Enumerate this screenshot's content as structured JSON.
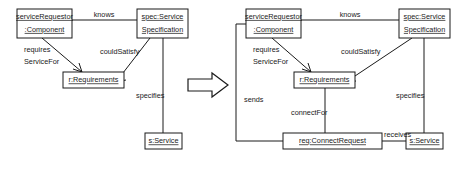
{
  "figure": {
    "type": "uml-object-diagram-pair",
    "background": "#ffffff",
    "stroke_color": "#1a1a1a",
    "transform_icon": "block-arrow-right-icon"
  },
  "left_diagram": {
    "name": "before-transformation",
    "nodes": {
      "service_requestor": {
        "line1": "serviceRequestor",
        "line2": ":Component"
      },
      "spec": {
        "line1": "spec:Service",
        "line2": "Specification"
      },
      "requirements": {
        "line1": "r:Requirements"
      },
      "service": {
        "line1": "s:Service"
      }
    },
    "edges": {
      "knows": "knows",
      "requires_line1": "requires",
      "requires_line2": "ServiceFor",
      "could_satisfy": "couldSatisfy",
      "specifies": "specifies"
    }
  },
  "right_diagram": {
    "name": "after-transformation",
    "nodes": {
      "service_requestor": {
        "line1": "serviceRequestor",
        "line2": ":Component"
      },
      "spec": {
        "line1": "spec:Service",
        "line2": "Specification"
      },
      "requirements": {
        "line1": "r:Requirements"
      },
      "connect_request": {
        "line1": "req:ConnectRequest"
      },
      "service": {
        "line1": "s:Service"
      }
    },
    "edges": {
      "knows": "knows",
      "requires_line1": "requires",
      "requires_line2": "ServiceFor",
      "could_satisfy": "couldSatisfy",
      "specifies": "specifies",
      "sends": "sends",
      "connect_for": "connectFor",
      "receives": "receives"
    }
  }
}
